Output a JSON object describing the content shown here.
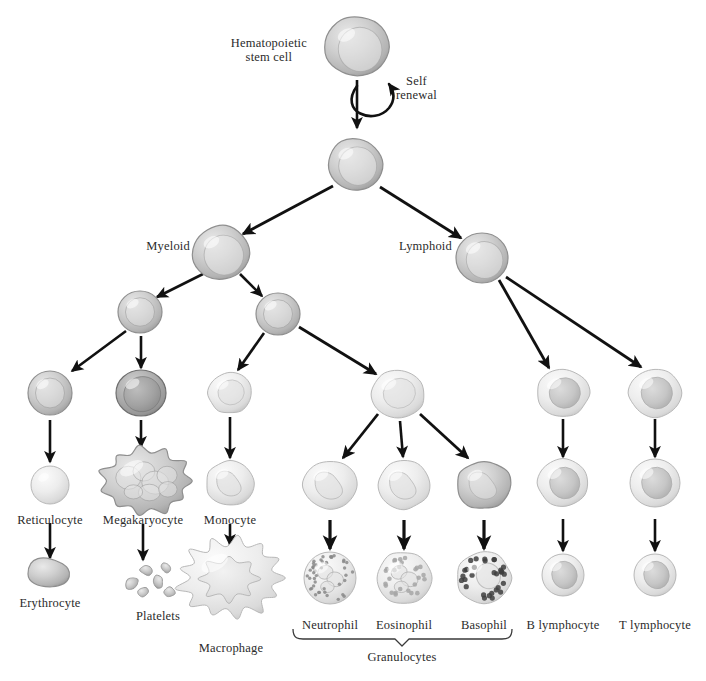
{
  "figure": {
    "background_color": "#ffffff",
    "text_color": "#2b2b2b",
    "arrow_color": "#111111"
  },
  "labels": {
    "stem_cell_line1": "Hematopoietic",
    "stem_cell_line2": "stem cell",
    "self_renewal_line1": "Self",
    "self_renewal_line2": "renewal",
    "myeloid": "Myeloid",
    "lymphoid": "Lymphoid",
    "reticulocyte": "Reticulocyte",
    "erythrocyte": "Erythrocyte",
    "megakaryocyte": "Megakaryocyte",
    "platelets": "Platelets",
    "monocyte": "Monocyte",
    "macrophage": "Macrophage",
    "neutrophil": "Neutrophil",
    "eosinophil": "Eosinophil",
    "basophil": "Basophil",
    "granulocytes": "Granulocytes",
    "b_lymphocyte": "B lymphocyte",
    "t_lymphocyte": "T lymphocyte"
  },
  "label_positions": {
    "stem_cell": {
      "x": 307,
      "y": 36,
      "align": "right"
    },
    "self_renewal": {
      "x": 396,
      "y": 74,
      "align": "left"
    },
    "myeloid": {
      "x": 190,
      "y": 239,
      "align": "right"
    },
    "lymphoid": {
      "x": 452,
      "y": 239,
      "align": "right"
    },
    "reticulocyte": {
      "x": 50,
      "y": 513,
      "align": "center"
    },
    "erythrocyte": {
      "x": 50,
      "y": 596,
      "align": "center"
    },
    "megakaryocyte": {
      "x": 143,
      "y": 513,
      "align": "center"
    },
    "platelets": {
      "x": 158,
      "y": 609,
      "align": "center"
    },
    "monocyte": {
      "x": 230,
      "y": 513,
      "align": "center"
    },
    "macrophage": {
      "x": 231,
      "y": 641,
      "align": "center"
    },
    "neutrophil": {
      "x": 330,
      "y": 618,
      "align": "center"
    },
    "eosinophil": {
      "x": 404,
      "y": 618,
      "align": "center"
    },
    "basophil": {
      "x": 484,
      "y": 618,
      "align": "center"
    },
    "granulocytes": {
      "x": 402,
      "y": 650,
      "align": "center"
    },
    "b_lymphocyte": {
      "x": 563,
      "y": 618,
      "align": "center"
    },
    "t_lymphocyte": {
      "x": 655,
      "y": 618,
      "align": "center"
    }
  },
  "cells": [
    {
      "name": "hematopoietic-stem-cell",
      "cx": 357,
      "cy": 47,
      "rx": 31,
      "ry": 30,
      "shape": "blob-rounded",
      "tone": "mid",
      "nucleus": "large-offset"
    },
    {
      "name": "multipotent-progenitor",
      "cx": 355,
      "cy": 164,
      "rx": 27,
      "ry": 26,
      "shape": "blob-rounded",
      "tone": "mid",
      "nucleus": "large-offset"
    },
    {
      "name": "myeloid-progenitor",
      "cx": 221,
      "cy": 253,
      "rx": 28,
      "ry": 27,
      "shape": "blob-rounded",
      "tone": "mid",
      "nucleus": "large-offset"
    },
    {
      "name": "lymphoid-progenitor",
      "cx": 482,
      "cy": 258,
      "rx": 26,
      "ry": 25,
      "shape": "round",
      "tone": "mid",
      "nucleus": "large-offset"
    },
    {
      "name": "erythroid-progenitor",
      "cx": 140,
      "cy": 312,
      "rx": 22,
      "ry": 21,
      "shape": "round",
      "tone": "mid",
      "nucleus": "ring"
    },
    {
      "name": "granulocyte-monocyte-progenitor",
      "cx": 278,
      "cy": 314,
      "rx": 22,
      "ry": 21,
      "shape": "round",
      "tone": "mid",
      "nucleus": "ring"
    },
    {
      "name": "proerythroblast",
      "cx": 50,
      "cy": 393,
      "rx": 22,
      "ry": 22,
      "shape": "round",
      "tone": "mid",
      "nucleus": "ring"
    },
    {
      "name": "megakaryoblast",
      "cx": 141,
      "cy": 393,
      "rx": 25,
      "ry": 23,
      "shape": "round",
      "tone": "dark",
      "nucleus": "big-dark"
    },
    {
      "name": "monoblast",
      "cx": 230,
      "cy": 393,
      "rx": 22,
      "ry": 20,
      "shape": "blob-soft",
      "tone": "light",
      "nucleus": "soft"
    },
    {
      "name": "myeloblast",
      "cx": 398,
      "cy": 394,
      "rx": 27,
      "ry": 24,
      "shape": "blob-soft",
      "tone": "light",
      "nucleus": "soft"
    },
    {
      "name": "b-lymphoblast",
      "cx": 563,
      "cy": 393,
      "rx": 26,
      "ry": 23,
      "shape": "blob-soft",
      "tone": "light",
      "nucleus": "oval-grey"
    },
    {
      "name": "t-lymphoblast",
      "cx": 655,
      "cy": 393,
      "rx": 26,
      "ry": 24,
      "shape": "blob-soft",
      "tone": "light",
      "nucleus": "oval-grey"
    },
    {
      "name": "reticulocyte",
      "cx": 50,
      "cy": 485,
      "rx": 19,
      "ry": 19,
      "shape": "round",
      "tone": "light",
      "nucleus": "none"
    },
    {
      "name": "megakaryocyte",
      "cx": 146,
      "cy": 481,
      "rx": 42,
      "ry": 32,
      "shape": "lobed-giant",
      "tone": "mid",
      "nucleus": "multi-lobe"
    },
    {
      "name": "promonocyte",
      "cx": 230,
      "cy": 483,
      "rx": 24,
      "ry": 22,
      "shape": "blob-soft",
      "tone": "light",
      "nucleus": "kidney"
    },
    {
      "name": "neutrophil-precursor",
      "cx": 330,
      "cy": 485,
      "rx": 27,
      "ry": 24,
      "shape": "blob-soft",
      "tone": "light",
      "nucleus": "kidney"
    },
    {
      "name": "eosinophil-precursor",
      "cx": 404,
      "cy": 485,
      "rx": 26,
      "ry": 24,
      "shape": "blob-soft",
      "tone": "light",
      "nucleus": "kidney"
    },
    {
      "name": "basophil-precursor",
      "cx": 484,
      "cy": 485,
      "rx": 27,
      "ry": 24,
      "shape": "blob-soft",
      "tone": "mid",
      "nucleus": "kidney"
    },
    {
      "name": "b-lymphocyte-intermediate",
      "cx": 563,
      "cy": 483,
      "rx": 25,
      "ry": 24,
      "shape": "blob-soft",
      "tone": "light",
      "nucleus": "oval-grey"
    },
    {
      "name": "t-lymphocyte-intermediate",
      "cx": 655,
      "cy": 483,
      "rx": 25,
      "ry": 24,
      "shape": "round",
      "tone": "light",
      "nucleus": "oval-grey"
    },
    {
      "name": "erythrocyte",
      "cx": 50,
      "cy": 573,
      "rx": 22,
      "ry": 11,
      "shape": "biconcave",
      "tone": "mid",
      "nucleus": "none"
    },
    {
      "name": "macrophage",
      "cx": 231,
      "cy": 578,
      "rx": 48,
      "ry": 37,
      "shape": "amoeboid",
      "tone": "light",
      "nucleus": "lobed-pale"
    },
    {
      "name": "neutrophil",
      "cx": 330,
      "cy": 578,
      "rx": 26,
      "ry": 26,
      "shape": "round",
      "tone": "light",
      "nucleus": "granules-fine"
    },
    {
      "name": "eosinophil",
      "cx": 404,
      "cy": 578,
      "rx": 27,
      "ry": 26,
      "shape": "blob-soft",
      "tone": "light",
      "nucleus": "granules-coarse"
    },
    {
      "name": "basophil",
      "cx": 484,
      "cy": 578,
      "rx": 27,
      "ry": 26,
      "shape": "blob-soft",
      "tone": "light",
      "nucleus": "granules-dark"
    },
    {
      "name": "b-lymphocyte",
      "cx": 563,
      "cy": 575,
      "rx": 21,
      "ry": 21,
      "shape": "round",
      "tone": "light",
      "nucleus": "oval-grey"
    },
    {
      "name": "t-lymphocyte",
      "cx": 655,
      "cy": 575,
      "rx": 21,
      "ry": 21,
      "shape": "round",
      "tone": "light",
      "nucleus": "oval-grey"
    }
  ],
  "arrows": [
    {
      "name": "arrow-stem-to-progenitor",
      "x1": 357,
      "y1": 80,
      "x2": 357,
      "y2": 128,
      "width": 2.6
    },
    {
      "name": "arrow-progenitor-to-myeloid",
      "x1": 333,
      "y1": 186,
      "x2": 243,
      "y2": 234,
      "width": 2.8
    },
    {
      "name": "arrow-progenitor-to-lymphoid",
      "x1": 380,
      "y1": 187,
      "x2": 461,
      "y2": 238,
      "width": 2.8
    },
    {
      "name": "arrow-myeloid-to-erythroid",
      "x1": 203,
      "y1": 274,
      "x2": 157,
      "y2": 297,
      "width": 2.6
    },
    {
      "name": "arrow-myeloid-to-gm-progenitor",
      "x1": 240,
      "y1": 274,
      "x2": 262,
      "y2": 296,
      "width": 2.6
    },
    {
      "name": "arrow-erythroid-to-proerythroblast",
      "x1": 126,
      "y1": 331,
      "x2": 72,
      "y2": 371,
      "width": 2.6
    },
    {
      "name": "arrow-erythroid-to-megakaryoblast",
      "x1": 141,
      "y1": 336,
      "x2": 141,
      "y2": 368,
      "width": 2.6
    },
    {
      "name": "arrow-gm-to-monoblast",
      "x1": 264,
      "y1": 333,
      "x2": 238,
      "y2": 370,
      "width": 2.6
    },
    {
      "name": "arrow-gm-to-myeloblast",
      "x1": 299,
      "y1": 327,
      "x2": 376,
      "y2": 374,
      "width": 2.8
    },
    {
      "name": "arrow-lymphoid-to-b",
      "x1": 499,
      "y1": 280,
      "x2": 549,
      "y2": 368,
      "width": 2.8
    },
    {
      "name": "arrow-lymphoid-to-t",
      "x1": 506,
      "y1": 277,
      "x2": 641,
      "y2": 367,
      "width": 2.8
    },
    {
      "name": "arrow-proerythroblast-to-reticulocyte",
      "x1": 50,
      "y1": 420,
      "x2": 50,
      "y2": 462,
      "width": 2.6
    },
    {
      "name": "arrow-megakaryoblast-to-megakaryocyte",
      "x1": 141,
      "y1": 420,
      "x2": 141,
      "y2": 447,
      "width": 2.6
    },
    {
      "name": "arrow-monoblast-to-promonocyte",
      "x1": 230,
      "y1": 417,
      "x2": 230,
      "y2": 458,
      "width": 2.6
    },
    {
      "name": "arrow-myeloblast-to-neutrophil-pre",
      "x1": 378,
      "y1": 414,
      "x2": 343,
      "y2": 458,
      "width": 2.8
    },
    {
      "name": "arrow-myeloblast-to-eosinophil-pre",
      "x1": 400,
      "y1": 421,
      "x2": 403,
      "y2": 457,
      "width": 2.6
    },
    {
      "name": "arrow-myeloblast-to-basophil-pre",
      "x1": 420,
      "y1": 414,
      "x2": 468,
      "y2": 458,
      "width": 2.8
    },
    {
      "name": "arrow-b-blast-to-b-inter",
      "x1": 563,
      "y1": 419,
      "x2": 563,
      "y2": 457,
      "width": 2.6
    },
    {
      "name": "arrow-t-blast-to-t-inter",
      "x1": 655,
      "y1": 419,
      "x2": 655,
      "y2": 457,
      "width": 2.6
    },
    {
      "name": "arrow-reticulocyte-to-erythrocyte",
      "x1": 50,
      "y1": 523,
      "x2": 50,
      "y2": 558,
      "width": 2.6
    },
    {
      "name": "arrow-megakaryocyte-to-platelets",
      "x1": 143,
      "y1": 524,
      "x2": 143,
      "y2": 560,
      "width": 2.6
    },
    {
      "name": "arrow-promonocyte-to-macrophage",
      "x1": 230,
      "y1": 524,
      "x2": 230,
      "y2": 545,
      "width": 2.6
    },
    {
      "name": "arrow-pre-to-neutrophil",
      "x1": 330,
      "y1": 520,
      "x2": 330,
      "y2": 549,
      "width": 3.2
    },
    {
      "name": "arrow-pre-to-eosinophil",
      "x1": 404,
      "y1": 520,
      "x2": 404,
      "y2": 549,
      "width": 3.2
    },
    {
      "name": "arrow-pre-to-basophil",
      "x1": 484,
      "y1": 520,
      "x2": 484,
      "y2": 549,
      "width": 3.2
    },
    {
      "name": "arrow-b-inter-to-b-lymphocyte",
      "x1": 563,
      "y1": 519,
      "x2": 563,
      "y2": 551,
      "width": 2.6
    },
    {
      "name": "arrow-t-inter-to-t-lymphocyte",
      "x1": 655,
      "y1": 519,
      "x2": 655,
      "y2": 551,
      "width": 2.6
    }
  ],
  "platelet_fragments": [
    {
      "cx": 146,
      "cy": 570,
      "r": 6.0,
      "rot": 20
    },
    {
      "cx": 132,
      "cy": 583,
      "r": 6.5,
      "rot": -30
    },
    {
      "cx": 158,
      "cy": 582,
      "r": 6.2,
      "rot": 55
    },
    {
      "cx": 143,
      "cy": 592,
      "r": 5.6,
      "rot": -10
    },
    {
      "cx": 166,
      "cy": 568,
      "r": 5.2,
      "rot": 40
    },
    {
      "cx": 170,
      "cy": 592,
      "r": 5.8,
      "rot": 15
    }
  ],
  "granulocyte_brace": {
    "name": "granulocytes-brace",
    "x_left": 293,
    "x_right": 512,
    "y_top": 629,
    "y_bottom": 639,
    "x_center": 402
  },
  "self_renewal_arc": {
    "name": "self-renewal-arc",
    "path": "M 357 86 C 338 112, 374 126, 389 108 C 396 99, 394 91, 389 84"
  }
}
